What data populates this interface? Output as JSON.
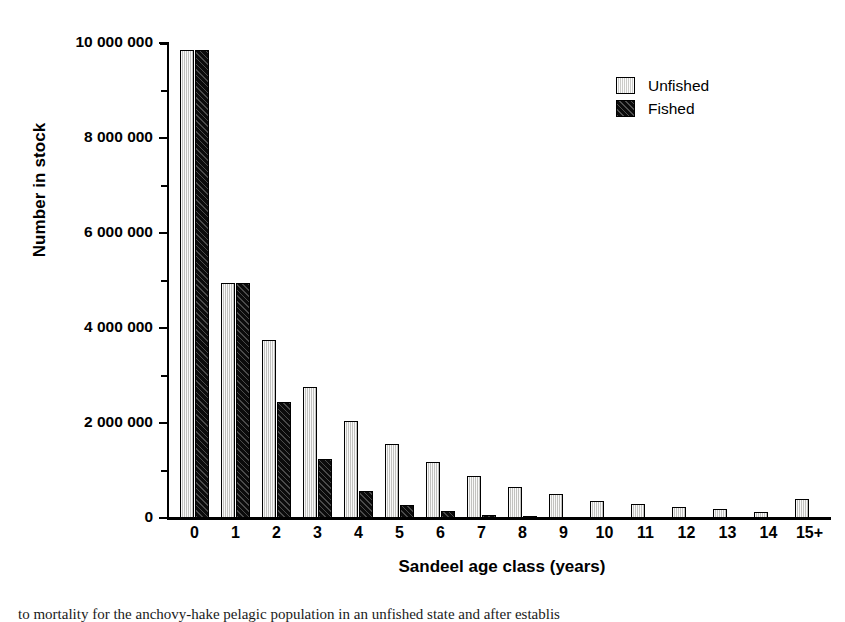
{
  "chart_data": {
    "type": "bar",
    "title": "",
    "xlabel": "Sandeel age class (years)",
    "ylabel": "Number in stock",
    "categories": [
      "0",
      "1",
      "2",
      "3",
      "4",
      "5",
      "6",
      "7",
      "8",
      "9",
      "10",
      "11",
      "12",
      "13",
      "14",
      "15+"
    ],
    "series": [
      {
        "name": "Unfished",
        "color": "#d9d9d6",
        "values": [
          9850000,
          4950000,
          3750000,
          2750000,
          2050000,
          1550000,
          1180000,
          880000,
          650000,
          500000,
          360000,
          300000,
          240000,
          200000,
          130000,
          400000
        ]
      },
      {
        "name": "Fished",
        "color": "#0b0b0b",
        "values": [
          9850000,
          4950000,
          2450000,
          1250000,
          560000,
          270000,
          140000,
          60000,
          20000,
          0,
          0,
          0,
          0,
          0,
          0,
          0
        ]
      }
    ],
    "ylim": [
      0,
      10000000
    ],
    "ytick_values": [
      0,
      2000000,
      4000000,
      6000000,
      8000000,
      10000000
    ],
    "ytick_labels": [
      "0",
      "2 000 000",
      "4 000 000",
      "6 000 000",
      "8 000 000",
      "10 000 000"
    ],
    "yminor_tick_values": [
      1000000,
      3000000,
      5000000,
      7000000,
      9000000
    ],
    "grid": false,
    "legend_position": "top-right"
  },
  "legend": {
    "items": [
      {
        "label": "Unfished"
      },
      {
        "label": "Fished"
      }
    ]
  },
  "caption": {
    "text": "to mortality for the anchovy-hake pelagic population in an unfished state and after establis"
  }
}
